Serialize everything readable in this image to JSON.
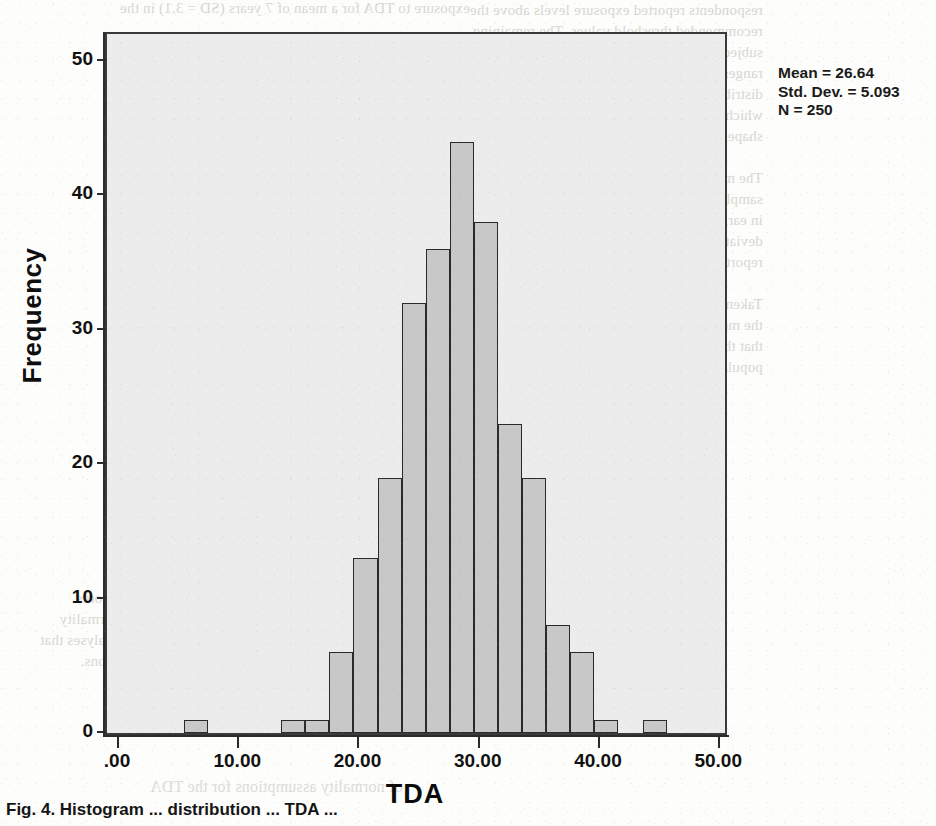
{
  "document": {
    "caption": "Fig. 4. Histogram ... distribution ... TDA ..."
  },
  "stats": {
    "mean_line": "Mean = 26.64",
    "std_line": "Std. Dev. = 5.093",
    "n_line": "N = 250"
  },
  "bleed_text": {
    "top_strip": "exposure to TDA for a mean of 7 years (SD = 3.1) in the",
    "right_block": "respondents reported exposure levels above the\nrecommended threshold values. The remaining\nsubjects were distributed across the lower\nranges of the scale. A histogram of the total\ndistribution is presented in Figure 4 below,\nwhich indicates an approximately normal\nshape with slight positive skew.\n\nThe mean value obtained in the present\nsample was comparable with values reported\nin earlier investigations, although the standard\ndeviation was somewhat smaller than that\nreported by previous authors.\n\nTaken together, these results suggest that\nthe measurement procedure is reliable and\nthat the sample is representative of the wider\npopulation under study.",
    "lower_block": "the observed distribution of scores\nsupports the assumption of normality\nrequired for the parametric analyses that\nfollow in the subsequent sections.",
    "caption_ghost": "of normality assumptions for the TDA"
  },
  "chart_data": {
    "type": "bar",
    "title": "",
    "xlabel": "TDA",
    "ylabel": "Frequency",
    "xlim": [
      -1.0,
      50.4
    ],
    "ylim": [
      0,
      52
    ],
    "grid": false,
    "legend": null,
    "bin_width": 2.0,
    "x_ticks": [
      {
        "value": 0,
        "label": ".00"
      },
      {
        "value": 10,
        "label": "10.00"
      },
      {
        "value": 20,
        "label": "20.00"
      },
      {
        "value": 30,
        "label": "30.00"
      },
      {
        "value": 40,
        "label": "40.00"
      },
      {
        "value": 50,
        "label": "50.00"
      }
    ],
    "y_ticks": [
      {
        "value": 0,
        "label": "0"
      },
      {
        "value": 10,
        "label": "10"
      },
      {
        "value": 20,
        "label": "20"
      },
      {
        "value": 30,
        "label": "30"
      },
      {
        "value": 40,
        "label": "40"
      },
      {
        "value": 50,
        "label": "50"
      }
    ],
    "bars": [
      {
        "x0": 5.4,
        "x1": 7.4,
        "value": 1
      },
      {
        "x0": 13.5,
        "x1": 15.5,
        "value": 1
      },
      {
        "x0": 15.5,
        "x1": 17.5,
        "value": 1
      },
      {
        "x0": 17.5,
        "x1": 19.5,
        "value": 6
      },
      {
        "x0": 19.5,
        "x1": 21.5,
        "value": 13
      },
      {
        "x0": 21.5,
        "x1": 23.5,
        "value": 19
      },
      {
        "x0": 23.5,
        "x1": 25.5,
        "value": 32
      },
      {
        "x0": 25.5,
        "x1": 27.5,
        "value": 36
      },
      {
        "x0": 27.5,
        "x1": 29.5,
        "value": 44
      },
      {
        "x0": 29.5,
        "x1": 31.5,
        "value": 38
      },
      {
        "x0": 31.5,
        "x1": 33.5,
        "value": 23
      },
      {
        "x0": 33.5,
        "x1": 35.5,
        "value": 19
      },
      {
        "x0": 35.5,
        "x1": 37.5,
        "value": 8
      },
      {
        "x0": 37.5,
        "x1": 39.5,
        "value": 6
      },
      {
        "x0": 39.5,
        "x1": 41.5,
        "value": 1
      },
      {
        "x0": 43.6,
        "x1": 45.6,
        "value": 1
      }
    ],
    "summary": {
      "mean": 26.64,
      "std_dev": 5.093,
      "n": 250
    },
    "colors": {
      "bar_fill": "#c8c8c8",
      "bar_edge": "#2a2a2a",
      "plot_background": "#ececec",
      "axis": "#2b2b2b"
    }
  }
}
